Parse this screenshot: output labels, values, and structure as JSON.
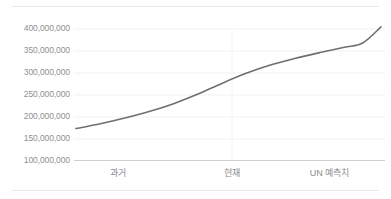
{
  "chart_data": {
    "type": "line",
    "title": "",
    "subtitle": "",
    "xlabel": "",
    "ylabel": "",
    "grid": true,
    "legend": null,
    "legend_position": "none",
    "categories": [
      "과거",
      "현재",
      "UN 예측치"
    ],
    "ytick_labels": [
      "400,000,000",
      "350,000,000",
      "300,000,000",
      "250,000,000",
      "200,000,000",
      "150,000,000",
      "100,000,000"
    ],
    "ytick_values": [
      400000000,
      350000000,
      300000000,
      250000000,
      200000000,
      150000000,
      100000000
    ],
    "ylim": [
      100000000,
      400000000
    ],
    "xlim": [
      0,
      100
    ],
    "series": [
      {
        "name": "인구",
        "color": "#6f6f6f",
        "x": [
          0,
          8,
          16,
          24,
          32,
          40,
          48,
          56,
          64,
          72,
          80,
          88,
          94,
          100
        ],
        "values": [
          172000000,
          183000000,
          196000000,
          211000000,
          229000000,
          251000000,
          276000000,
          299000000,
          318000000,
          333000000,
          346000000,
          358000000,
          368000000,
          405000000
        ]
      }
    ],
    "annotations": []
  },
  "axis": {
    "x_tick_positions_pct": [
      31,
      59,
      85
    ],
    "baseline_value": 100000000
  },
  "colors": {
    "line": "#6f6f6f",
    "grid": "#f0f0f0",
    "axis_baseline": "#cfcfcf",
    "tick_text": "#8e8e8e",
    "frame_rule": "#e9e9e9",
    "background": "#ffffff"
  }
}
